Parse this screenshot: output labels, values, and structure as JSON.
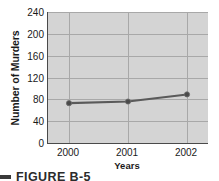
{
  "chart_data": {
    "type": "line",
    "title": "",
    "xlabel": "Years",
    "ylabel": "Number of Murders",
    "categories": [
      "2000",
      "2001",
      "2002"
    ],
    "values": [
      73,
      76,
      89
    ],
    "series": [
      {
        "name": "Number of Murders",
        "values": [
          73,
          76,
          89
        ]
      }
    ],
    "ylim": [
      0,
      240
    ],
    "yticks": [
      240,
      200,
      160,
      120,
      80,
      40,
      0
    ],
    "ytick_labels": [
      "240",
      "200",
      "160",
      "120",
      "80",
      "40",
      "0"
    ],
    "xtick_labels": [
      "2000",
      "2001",
      "2002"
    ],
    "grid": true,
    "legend": false,
    "marker": "circle",
    "line_color": "#5a5a5a",
    "marker_color": "#4a4a4a",
    "plot_background": "#d4d4d4",
    "grid_color": "#a8a8a8",
    "axis_color": "#4a4a4a"
  },
  "caption": {
    "label": "FIGURE B-5"
  }
}
